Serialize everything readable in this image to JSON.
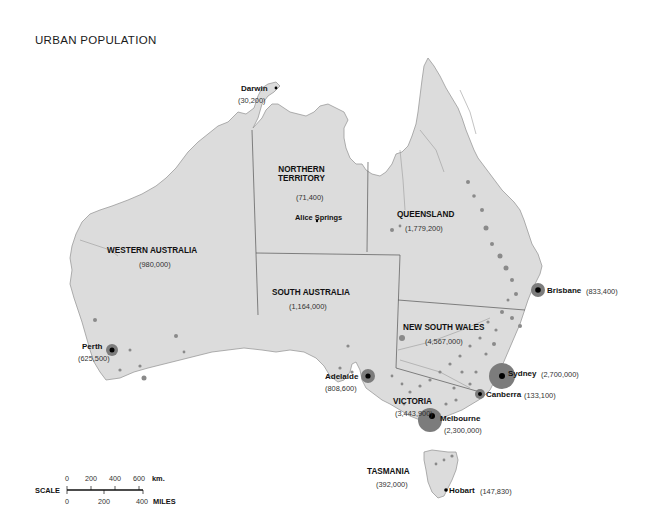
{
  "map": {
    "title": "URBAN POPULATION",
    "land_color": "#dcdcdc",
    "border_color": "#555555",
    "dot_color": "#8a8a8a",
    "city_marker_color": "#000000"
  },
  "regions": [
    {
      "name": "NORTHERN",
      "name2": "TERRITORY",
      "population": "(71,400)"
    },
    {
      "name": "QUEENSLAND",
      "population": "(1,779,200)"
    },
    {
      "name": "WESTERN AUSTRALIA",
      "population": "(980,000)"
    },
    {
      "name": "SOUTH AUSTRALIA",
      "population": "(1,164,000)"
    },
    {
      "name": "NEW SOUTH WALES",
      "population": "(4,567,000)"
    },
    {
      "name": "VICTORIA",
      "population": "(3,443,900)"
    },
    {
      "name": "TASMANIA",
      "population": "(392,000)"
    }
  ],
  "cities": [
    {
      "name": "Darwin",
      "population": "(30,200)"
    },
    {
      "name": "Alice Springs",
      "population": ""
    },
    {
      "name": "Brisbane",
      "population": "(833,400)"
    },
    {
      "name": "Perth",
      "population": "(625,500)"
    },
    {
      "name": "Adelaide",
      "population": "(808,600)"
    },
    {
      "name": "Sydney",
      "population": "(2,700,000)"
    },
    {
      "name": "Canberra",
      "population": "(133,100)"
    },
    {
      "name": "Melbourne",
      "population": "(2,300,000)"
    },
    {
      "name": "Hobart",
      "population": "(147,830)"
    }
  ],
  "scale": {
    "label": "SCALE",
    "km_unit": "km.",
    "km_ticks": [
      "0",
      "200",
      "400",
      "600"
    ],
    "miles_unit": "MILES",
    "miles_ticks": [
      "0",
      "200",
      "400"
    ]
  }
}
